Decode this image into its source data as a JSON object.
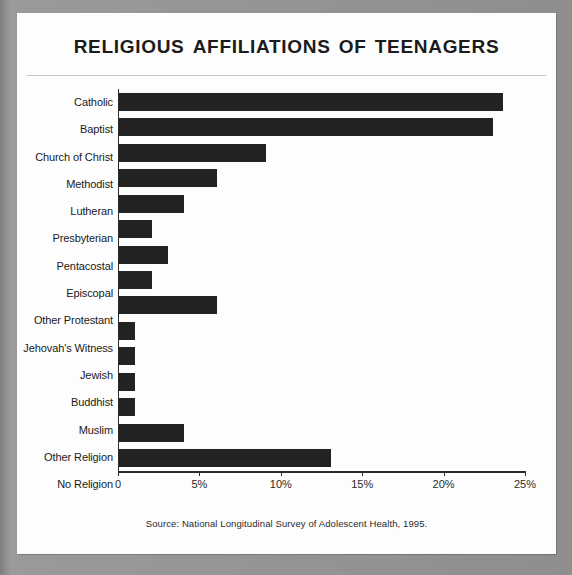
{
  "title": "Religious Affiliations of Teenagers",
  "source_note": "Source: National Longitudinal Survey of Adolescent Health, 1995.",
  "colors": {
    "bar": "#222222",
    "axis": "#2b2b2b",
    "text": "#1a1a1a",
    "card_background": "#fdfdfd",
    "page_surround": "#8c8c8c"
  },
  "chart_data": {
    "type": "bar",
    "orientation": "horizontal",
    "title": "Religious Affiliations of Teenagers",
    "xlabel": "",
    "ylabel": "",
    "xlim": [
      0,
      25
    ],
    "grid": false,
    "legend": false,
    "tick_labels": [
      "0",
      "5%",
      "10%",
      "15%",
      "20%",
      "25%"
    ],
    "tick_values": [
      0,
      5,
      10,
      15,
      20,
      25
    ],
    "categories": [
      "Catholic",
      "Baptist",
      "Church of Christ",
      "Methodist",
      "Lutheran",
      "Presbyterian",
      "Pentacostal",
      "Episcopal",
      "Other Protestant",
      "Jehovah's Witness",
      "Jewish",
      "Buddhist",
      "Muslim",
      "Other Religion",
      "No Religion"
    ],
    "values": [
      23.6,
      23,
      9,
      6,
      4,
      2,
      3,
      2,
      6,
      1,
      1,
      1,
      1,
      4,
      13
    ],
    "annotations": [
      "Source: National Longitudinal Survey of Adolescent Health, 1995."
    ]
  }
}
